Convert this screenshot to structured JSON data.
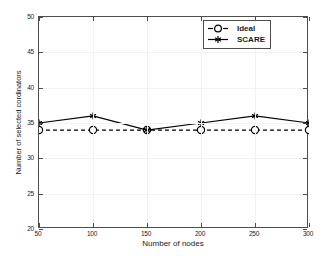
{
  "chart_data": {
    "type": "line",
    "title": "",
    "xlabel": "Number of nodes",
    "ylabel": "Number of selected cordinators",
    "x": [
      50,
      100,
      150,
      200,
      250,
      300
    ],
    "xlim": [
      50,
      300
    ],
    "ylim": [
      20,
      50
    ],
    "xticks": [
      50,
      100,
      150,
      200,
      250,
      300
    ],
    "yticks": [
      20,
      25,
      30,
      35,
      40,
      45,
      50
    ],
    "xtick_labels": [
      "50",
      "100",
      "150",
      "200",
      "250",
      "300"
    ],
    "ytick_labels": [
      "20",
      "25",
      "30",
      "35",
      "40",
      "45",
      "50"
    ],
    "grid": true,
    "legend_position": "top-right",
    "series": [
      {
        "name": "Ideal",
        "values": [
          34,
          34,
          34,
          34,
          34,
          34
        ],
        "line_style": "dashed",
        "marker": "circle",
        "color": "#000000"
      },
      {
        "name": "SCARE",
        "values": [
          35,
          36,
          34,
          35,
          36,
          35
        ],
        "line_style": "solid",
        "marker": "asterisk",
        "color": "#000000"
      }
    ]
  },
  "legend": {
    "items": [
      {
        "label": "Ideal"
      },
      {
        "label": "SCARE"
      }
    ]
  }
}
